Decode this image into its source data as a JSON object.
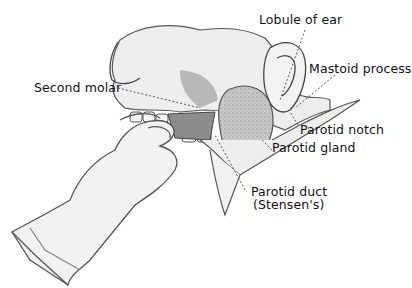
{
  "figure": {
    "labels": [
      {
        "id": "lobule",
        "text": "Lobule of ear"
      },
      {
        "id": "mastoid",
        "text": "Mastoid process"
      },
      {
        "id": "second_molar",
        "text": "Second molar"
      },
      {
        "id": "parotid_notch",
        "text": "Parotid notch"
      },
      {
        "id": "parotid_gland",
        "text": "Parotid gland"
      },
      {
        "id": "parotid_duct_line1",
        "text": "Parotid duct"
      },
      {
        "id": "parotid_duct_line2",
        "text": "(Stensen's)"
      }
    ]
  }
}
